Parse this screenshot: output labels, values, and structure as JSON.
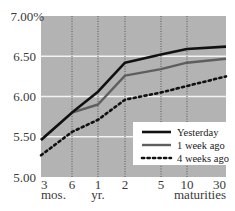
{
  "chart_data": {
    "type": "line",
    "title": "",
    "xlabel": "maturities",
    "ylabel": "",
    "ylim": [
      5.0,
      7.0
    ],
    "y_ticks": [
      "7.00%",
      "6.50",
      "6.00",
      "5.50",
      "5.00"
    ],
    "y_tick_values": [
      7.0,
      6.5,
      6.0,
      5.5,
      5.0
    ],
    "categories": [
      "3",
      "6",
      "1",
      "2",
      "5",
      "10",
      "30"
    ],
    "category_units": [
      {
        "under": "3",
        "label": "mos."
      },
      {
        "under": "1",
        "label": "yr."
      }
    ],
    "x_label_right": "maturities",
    "grid": {
      "horizontal": true,
      "vertical_dotted": true
    },
    "legend_position": "lower right",
    "series": [
      {
        "name": "Yesterday",
        "style": "solid-black",
        "values": [
          5.46,
          5.8,
          6.06,
          6.42,
          6.52,
          6.59,
          6.62
        ]
      },
      {
        "name": "1 week ago",
        "style": "solid-gray",
        "values": [
          5.46,
          5.8,
          5.9,
          6.26,
          6.34,
          6.42,
          6.47
        ]
      },
      {
        "name": "4 weeks ago",
        "style": "dotted-black",
        "values": [
          5.27,
          5.56,
          5.71,
          5.96,
          6.05,
          6.13,
          6.25
        ]
      }
    ]
  },
  "colors": {
    "plot_bg": "#b3b3b3",
    "gridline": "#f2f2f2",
    "yesterday": "#111111",
    "week1": "#5e5e5e",
    "week4": "#111111",
    "legend_bg": "#ffffff"
  }
}
